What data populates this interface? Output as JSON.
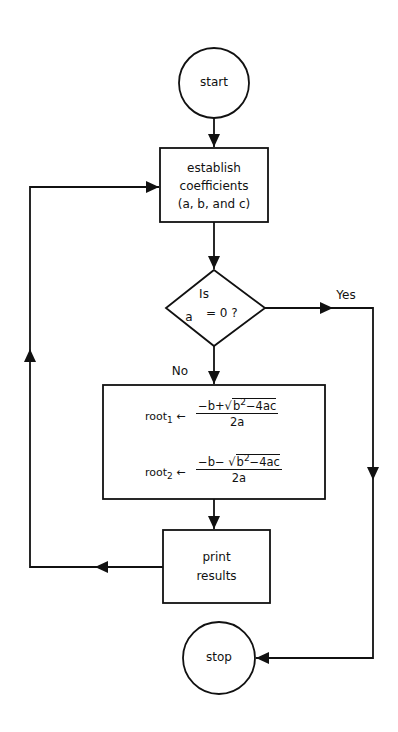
{
  "diagram": {
    "type": "flowchart",
    "nodes": {
      "start": {
        "shape": "circle",
        "label": "start"
      },
      "establish": {
        "shape": "rectangle",
        "lines": [
          "establish",
          "coefficients",
          "(a, b, and c)"
        ]
      },
      "decision": {
        "shape": "diamond",
        "line1": "Is",
        "line2_left": "a",
        "line2_right": "= 0 ?"
      },
      "compute": {
        "shape": "rectangle",
        "root1": {
          "lhs": "root",
          "sub": "1",
          "arrow": "←",
          "num_pre": "−b+",
          "radicand_base": "b",
          "radicand_exp": "2",
          "radicand_rest": "−4ac",
          "den": "2a"
        },
        "root2": {
          "lhs": "root",
          "sub": "2",
          "arrow": "←",
          "num_pre": "−b− ",
          "radicand_base": "b",
          "radicand_exp": "2",
          "radicand_rest": "−4ac",
          "den": "2a"
        }
      },
      "print": {
        "shape": "rectangle",
        "lines": [
          "print",
          "results"
        ]
      },
      "stop": {
        "shape": "circle",
        "label": "stop"
      }
    },
    "edges": {
      "yes_label": "Yes",
      "no_label": "No"
    }
  }
}
